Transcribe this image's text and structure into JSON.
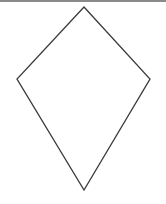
{
  "diagram": {
    "shape": "kite",
    "stroke_color": "#3a3a3a",
    "fill_color": "#ffffff",
    "stroke_width": 1.3,
    "vertices": {
      "top": [
        84,
        7
      ],
      "right": [
        150,
        79
      ],
      "bottom": [
        84,
        190
      ],
      "left": [
        17,
        79
      ]
    },
    "points": "84,7 150,79 84,190 17,79"
  },
  "frame": {
    "top_band_color": "#8a8a8a"
  }
}
